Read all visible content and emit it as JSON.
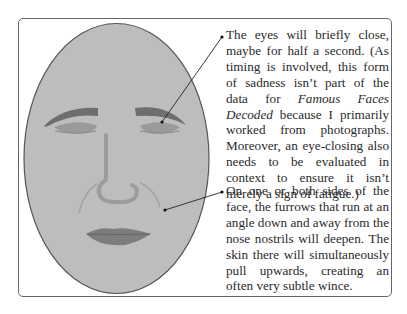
{
  "figure": {
    "colors": {
      "frame_border": "#666666",
      "face_fill": "#bdbdbd",
      "face_outline": "#555555",
      "eyebrow": "#6e6e6e",
      "eyelid": "#9a9a9a",
      "nose": "#9c9c9c",
      "furrow": "#a3a3a3",
      "lips": "#7d7d7d",
      "leader_line": "#222222"
    }
  },
  "callouts": [
    {
      "id": "eyes",
      "text_before": "The eyes will briefly close, maybe for half a second. (As timing is involved, this form of sadness isn’t part of the data for ",
      "emphasis": "Famous Faces Decoded",
      "text_after": " because I primarily worked from photographs. Moreover, an eye-closing also needs to be evaluated in context to ensure it isn’t merely a sign of fatigue.)",
      "target": "right-eye"
    },
    {
      "id": "furrows",
      "text_before": "On one or both sides of the face, the furrows that run at an angle down and away from the nose nostrils will deepen. The skin there will simultaneously pull upwards, creating an often very subtle wince.",
      "emphasis": "",
      "text_after": "",
      "target": "nasolabial-furrow"
    }
  ]
}
